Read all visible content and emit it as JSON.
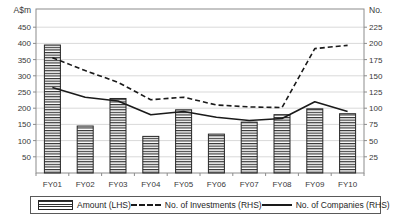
{
  "chart_data": {
    "type": "bar",
    "combo": "bar+line",
    "title": "",
    "categories": [
      "FY01",
      "FY02",
      "FY03",
      "FY04",
      "FY05",
      "FY06",
      "FY07",
      "FY08",
      "FY09",
      "FY10"
    ],
    "series": [
      {
        "name": "Amount (LHS)",
        "render": "bar",
        "axis": "left",
        "values": [
          395,
          145,
          230,
          113,
          195,
          120,
          157,
          180,
          198,
          183
        ]
      },
      {
        "name": "No. of Investments (RHS)",
        "render": "line",
        "style": "dashed",
        "axis": "right",
        "values": [
          178,
          158,
          140,
          113,
          117,
          105,
          102,
          101,
          192,
          197
        ]
      },
      {
        "name": "No. of Companies (RHS)",
        "render": "line",
        "style": "solid",
        "axis": "right",
        "values": [
          132,
          117,
          111,
          90,
          95,
          86,
          81,
          84,
          110,
          95
        ]
      }
    ],
    "left_axis": {
      "title": "A$m",
      "ticks": [
        450,
        400,
        350,
        300,
        250,
        200,
        150,
        100,
        50
      ],
      "min": 0,
      "units_per_px": 3.086
    },
    "right_axis": {
      "title": "No.",
      "ticks": [
        225,
        200,
        175,
        150,
        125,
        100,
        75,
        50,
        25
      ],
      "min": 0
    },
    "grid": "horizontal-light-gray",
    "legend_position": "bottom-boxed",
    "colors": {
      "ink": "#262626",
      "grid": "#d9d9d9",
      "frame": "#8c8c8c",
      "tick_text": "#383838",
      "background": "#ffffff"
    }
  },
  "legend": {
    "items": [
      {
        "label": "Amount (LHS)",
        "swatch": "striped-bar"
      },
      {
        "label": "No. of Investments (RHS)",
        "swatch": "dashed-line"
      },
      {
        "label": "No. of Companies (RHS)",
        "swatch": "solid-line"
      }
    ]
  }
}
